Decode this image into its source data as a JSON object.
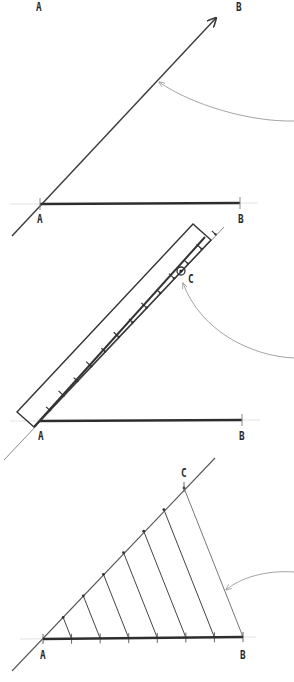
{
  "figure": {
    "colors": {
      "background": "#ffffff",
      "ink": "#3a3a3a",
      "segment": "#2e2e2e",
      "pointer": "#9a9a9a",
      "guide": "#d6d6d6"
    },
    "steps": [
      {
        "id": "step-1",
        "labels": [
          {
            "text": "A",
            "x": 36,
            "y": 0
          },
          {
            "text": "B",
            "x": 236,
            "y": 0
          },
          {
            "text": "A",
            "x": 37,
            "y": 212
          },
          {
            "text": "B",
            "x": 238,
            "y": 212
          }
        ],
        "ray": {
          "x1": 12,
          "y1": 236,
          "x2": 216,
          "y2": 18
        },
        "segment": {
          "x1": 40,
          "y1": 204,
          "x2": 240,
          "y2": 203
        },
        "pointer": {
          "d": "M294,121 C250,122 192,105 159,82"
        }
      },
      {
        "id": "step-2",
        "labels": [
          {
            "text": "C",
            "x": 188,
            "y": 272
          },
          {
            "text": "A",
            "x": 38,
            "y": 429
          },
          {
            "text": "B",
            "x": 239,
            "y": 429
          }
        ],
        "ray": {
          "x1": 4,
          "y1": 460,
          "x2": 224,
          "y2": 227
        },
        "segment": {
          "x1": 40,
          "y1": 421,
          "x2": 242,
          "y2": 420
        },
        "ruler": {
          "points": "34,427 17,412 193,224 211,240"
        },
        "tick_count": 12,
        "point_c": {
          "x": 181,
          "y": 271
        },
        "pointer": {
          "d": "M294,358 C250,356 200,330 183,283"
        }
      },
      {
        "id": "step-3",
        "labels": [
          {
            "text": "C",
            "x": 181,
            "y": 466
          },
          {
            "text": "A",
            "x": 40,
            "y": 648
          },
          {
            "text": "B",
            "x": 240,
            "y": 648
          }
        ],
        "ray": {
          "x1": 12,
          "y1": 671,
          "x2": 215,
          "y2": 458
        },
        "segment": {
          "x1": 43,
          "y1": 639,
          "x2": 243,
          "y2": 637
        },
        "divisions": 7,
        "point_c": {
          "x": 184,
          "y": 488
        },
        "pointer": {
          "d": "M294,572 C265,570 240,578 226,590"
        }
      }
    ]
  }
}
